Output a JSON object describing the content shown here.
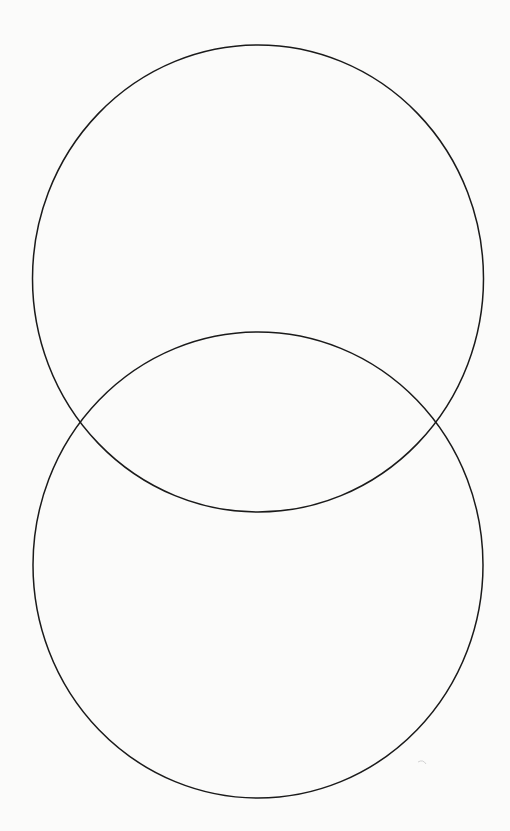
{
  "diagram": {
    "type": "venn",
    "set_count": 2,
    "orientation": "vertical",
    "background_color": "#fbfbfa",
    "stroke_color": "#1a1a1a",
    "stroke_width": 1.5,
    "sets": [
      {
        "id": "top",
        "label": "",
        "cx": 258,
        "cy": 278.5,
        "rx": 225.5,
        "ry": 233.5
      },
      {
        "id": "bottom",
        "label": "",
        "cx": 258,
        "cy": 565,
        "rx": 225,
        "ry": 233
      }
    ],
    "intersection_points": [
      {
        "x": 80,
        "y": 422
      },
      {
        "x": 436,
        "y": 422
      }
    ],
    "region_labels": {
      "top_only": "",
      "overlap": "",
      "bottom_only": ""
    }
  }
}
